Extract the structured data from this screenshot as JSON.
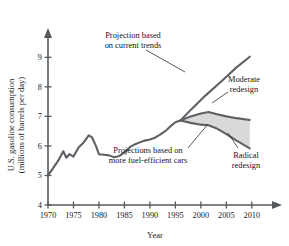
{
  "chart_data": {
    "type": "line",
    "title": "",
    "xlabel": "Year",
    "ylabel": "U.S. gasoline consumption (millions of barrels per day)",
    "ylabel_line1": "U.S. gasoline consumption",
    "ylabel_line2": "(millions of barrels per day)",
    "xlim": [
      1970,
      2012
    ],
    "ylim": [
      4,
      9.4
    ],
    "xticks": [
      1970,
      1975,
      1980,
      1985,
      1990,
      1995,
      2000,
      2005,
      2010
    ],
    "xtick_labels": [
      "1970",
      "1975",
      "1980",
      "1985",
      "1990",
      "1995",
      "2000",
      "2005",
      "2010"
    ],
    "yticks": [
      4,
      5,
      6,
      7,
      8,
      9
    ],
    "ytick_labels": [
      "4",
      "5",
      "6",
      "7",
      "8",
      "9"
    ],
    "grid": false,
    "legend": "none",
    "shaded_band": {
      "label": "range between moderate and radical redesign projections",
      "fill_color": "#d9d9d9"
    },
    "line_color": "#5d6165",
    "series": [
      {
        "name": "Historical consumption",
        "x": [
          1970,
          1971,
          1972,
          1973,
          1973.6,
          1974.2,
          1975,
          1976,
          1977,
          1978,
          1978.6,
          1979.4,
          1980,
          1981,
          1982,
          1983,
          1984,
          1985,
          1986,
          1987,
          1988,
          1989,
          1990,
          1991,
          1992,
          1993,
          1994,
          1995,
          1996
        ],
        "values": [
          5.0,
          5.25,
          5.5,
          5.82,
          5.6,
          5.72,
          5.64,
          5.95,
          6.12,
          6.36,
          6.3,
          6.0,
          5.72,
          5.7,
          5.68,
          5.62,
          5.66,
          5.78,
          5.95,
          6.05,
          6.12,
          6.18,
          6.22,
          6.28,
          6.38,
          6.5,
          6.66,
          6.8,
          6.86
        ]
      },
      {
        "name": "Projection based on current trends",
        "x": [
          1996,
          1998,
          2001,
          2004,
          2007,
          2009.6
        ],
        "values": [
          6.86,
          7.22,
          7.72,
          8.18,
          8.66,
          9.02
        ]
      },
      {
        "name": "Moderate redesign",
        "x": [
          1996,
          1998,
          2000,
          2001.5,
          2003,
          2005,
          2007,
          2009.6
        ],
        "values": [
          6.86,
          7.0,
          7.1,
          7.15,
          7.08,
          7.0,
          6.94,
          6.88
        ]
      },
      {
        "name": "Radical redesign",
        "x": [
          1996,
          1998,
          2000,
          2001.5,
          2003,
          2005,
          2007,
          2009.6
        ],
        "values": [
          6.86,
          6.78,
          6.72,
          6.7,
          6.6,
          6.4,
          6.18,
          5.92
        ]
      }
    ],
    "annotations": [
      {
        "name": "projection-current-trends",
        "lines": [
          "Projection based",
          "on current trends"
        ],
        "text": "Projection based on current trends",
        "x": 133,
        "y": 38,
        "align": "middle",
        "leader": [
          [
            146,
            50
          ],
          [
            185,
            72
          ]
        ]
      },
      {
        "name": "moderate-redesign",
        "lines": [
          "Moderate",
          "redesign"
        ],
        "text": "Moderate redesign",
        "x": 244,
        "y": 82,
        "align": "middle",
        "leader": [
          [
            228,
            92
          ],
          [
            212,
            103
          ]
        ]
      },
      {
        "name": "projections-fuel-efficient",
        "lines": [
          "Projections based on",
          "more fuel-efficient cars"
        ],
        "text": "Projections based on more fuel-efficient cars",
        "x": 148,
        "y": 153,
        "align": "middle",
        "leader": [
          [
            188,
            148
          ],
          [
            208,
            124
          ]
        ]
      },
      {
        "name": "radical-redesign",
        "lines": [
          "Radical",
          "redesign"
        ],
        "text": "Radical redesign",
        "x": 246,
        "y": 158,
        "align": "middle",
        "leader": [
          [
            238,
            148
          ],
          [
            228,
            133
          ]
        ]
      }
    ]
  }
}
